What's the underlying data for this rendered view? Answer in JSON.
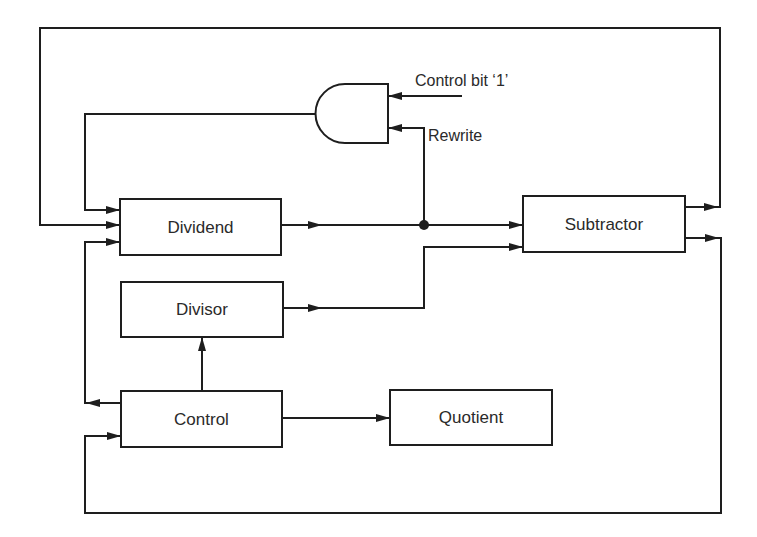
{
  "diagram": {
    "title": "",
    "blocks": {
      "dividend": {
        "label": "Dividend"
      },
      "divisor": {
        "label": "Divisor"
      },
      "control": {
        "label": "Control"
      },
      "quotient": {
        "label": "Quotient"
      },
      "subtractor": {
        "label": "Subtractor"
      },
      "and_gate": {
        "label": "AND gate"
      }
    },
    "signals": {
      "control_bit": "Control bit ‘1’",
      "rewrite": "Rewrite"
    },
    "connections": [
      {
        "from": "dividend",
        "to": "subtractor"
      },
      {
        "from": "dividend",
        "to": "and_gate",
        "label": "Rewrite"
      },
      {
        "from": "control_bit",
        "to": "and_gate"
      },
      {
        "from": "and_gate",
        "to": "dividend"
      },
      {
        "from": "divisor",
        "to": "subtractor"
      },
      {
        "from": "control",
        "to": "divisor"
      },
      {
        "from": "control",
        "to": "dividend"
      },
      {
        "from": "control",
        "to": "quotient"
      },
      {
        "from": "subtractor",
        "to": "dividend"
      },
      {
        "from": "subtractor",
        "to": "control"
      }
    ],
    "colors": {
      "line": "#1e1e1e",
      "text": "#2a2a2a",
      "background": "#ffffff"
    }
  }
}
